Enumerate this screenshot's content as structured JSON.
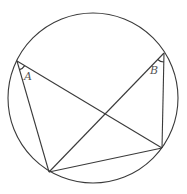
{
  "diagram": {
    "circle": {
      "cx": 93,
      "cy": 98,
      "r": 85
    },
    "points": {
      "A": {
        "x": 17,
        "y": 61
      },
      "B": {
        "x": 164,
        "y": 53
      },
      "P": {
        "x": 49,
        "y": 172
      },
      "Q": {
        "x": 162,
        "y": 148
      }
    },
    "segments": [
      {
        "from": "A",
        "to": "P"
      },
      {
        "from": "A",
        "to": "Q"
      },
      {
        "from": "B",
        "to": "P"
      },
      {
        "from": "B",
        "to": "Q"
      },
      {
        "from": "P",
        "to": "Q"
      }
    ],
    "labels": {
      "angle_a": "A",
      "angle_b": "B"
    },
    "stroke_color": "#3a3a3a",
    "label_color": "#555555"
  }
}
